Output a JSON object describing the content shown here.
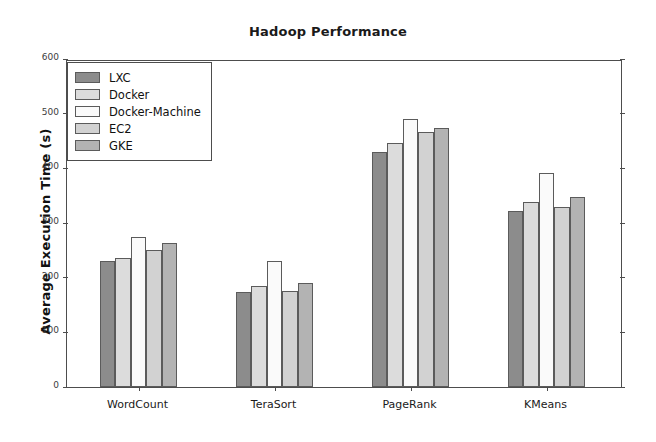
{
  "chart_data": {
    "type": "bar",
    "title": "Hadoop Performance",
    "xlabel": "",
    "ylabel": "Average Execution Time (s)",
    "categories": [
      "WordCount",
      "TeraSort",
      "PageRank",
      "KMeans"
    ],
    "series": [
      {
        "name": "LXC",
        "color": "#8c8c8c",
        "values": [
          231,
          173,
          429,
          322
        ]
      },
      {
        "name": "Docker",
        "color": "#dcdcdc",
        "values": [
          236,
          185,
          447,
          338
        ]
      },
      {
        "name": "Docker-Machine",
        "color": "#fafafa",
        "values": [
          275,
          230,
          490,
          391
        ]
      },
      {
        "name": "EC2",
        "color": "#d2d2d2",
        "values": [
          251,
          176,
          467,
          329
        ]
      },
      {
        "name": "GKE",
        "color": "#b3b3b3",
        "values": [
          263,
          190,
          473,
          348
        ]
      }
    ],
    "ylim": [
      0,
      600
    ],
    "yticks": [
      0,
      100,
      200,
      300,
      400,
      500,
      600
    ],
    "ytick_labels": [
      "0",
      "100",
      "200",
      "300",
      "400",
      "500",
      "600"
    ],
    "grid": false,
    "legend_position": "upper-left",
    "legend_entries": [
      "LXC",
      "Docker",
      "Docker-Machine",
      "EC2",
      "GKE"
    ]
  }
}
